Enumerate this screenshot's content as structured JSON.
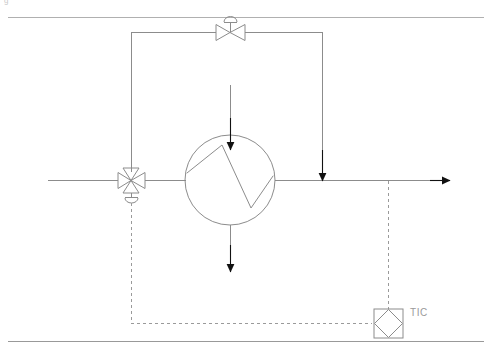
{
  "page": {
    "width": 492,
    "height": 355,
    "background": "#ffffff",
    "line_color": "#8c8c8c",
    "arrow_color": "#111111",
    "text_color": "#9a9a9a",
    "rule_color": "#aaaaaa"
  },
  "clipped_caption": {
    "left_fragment": "g",
    "mid_fragment": "'"
  },
  "instruments": {
    "tic": {
      "tag": "TIC",
      "shape": "square-with-diamond",
      "description": "Temperature indicating controller, shared display / DCS",
      "x": 388,
      "y": 323
    },
    "control_valve": {
      "tag": "",
      "shape": "globe-valve-with-diaphragm-actuator",
      "description": "Bypass control valve, diaphragm actuated",
      "x": 230,
      "y": 32
    },
    "three_way_valve": {
      "tag": "",
      "shape": "three-way-valve-with-actuator",
      "description": "Three-way diverting valve at exchanger inlet",
      "x": 131,
      "y": 180
    }
  },
  "equipment": {
    "heat_exchanger": {
      "tag": "",
      "shape": "circle-with-zigzag",
      "description": "Heat exchanger",
      "cx": 230,
      "cy": 180,
      "r": 45
    }
  },
  "streams": {
    "process_inlet": {
      "label": "",
      "direction": "right",
      "y": 180
    },
    "process_outlet": {
      "label": "",
      "direction": "right",
      "y": 180,
      "arrow": true
    },
    "bypass": {
      "label": "",
      "description": "Bypass around heat exchanger"
    },
    "service_inlet": {
      "label": "",
      "direction": "down",
      "arrow": true
    },
    "service_outlet": {
      "label": "",
      "direction": "down",
      "arrow": true
    }
  },
  "signals": {
    "measurement": {
      "style": "dashed",
      "description": "Temperature signal from process outlet to TIC"
    },
    "command": {
      "style": "dashed",
      "description": "Controller output to three-way valve"
    }
  }
}
